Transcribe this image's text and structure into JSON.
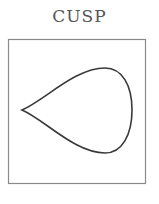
{
  "title": "CUSP",
  "colors": {
    "background": "#ffffff",
    "title": "#555555",
    "frame": "#8a8a8a",
    "curve": "#3a3a3a"
  },
  "figure": {
    "frame": {
      "x": 8,
      "y": 39,
      "width": 138,
      "height": 145
    },
    "curve": {
      "shape": "teardrop-cusp",
      "cusp_point": [
        22,
        110
      ],
      "top_point": [
        105,
        68
      ],
      "right_point": [
        132,
        110
      ],
      "bottom_point": [
        105,
        153
      ]
    }
  }
}
